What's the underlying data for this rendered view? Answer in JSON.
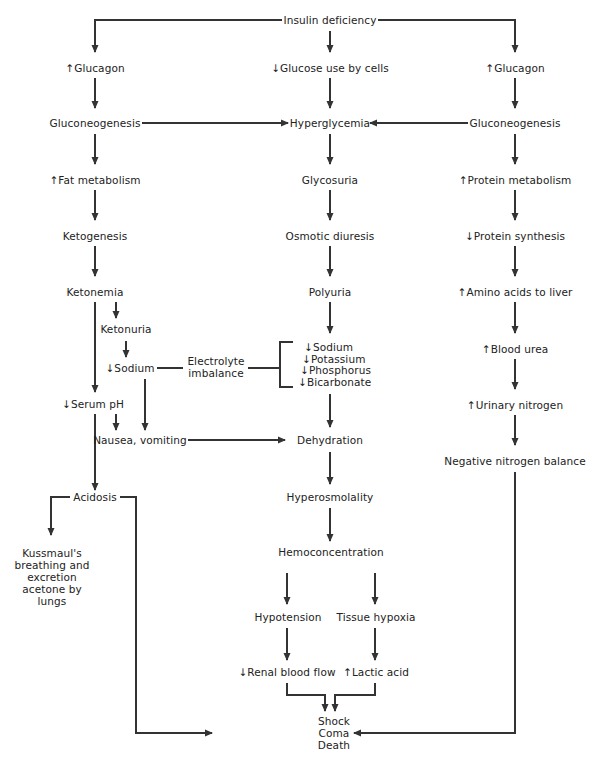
{
  "diagram": {
    "nodes": {
      "insulin_deficiency": "Insulin deficiency",
      "glucagon_left": "↑Glucagon",
      "glucose_use": "↓Glucose use by cells",
      "glucagon_right": "↑Glucagon",
      "gluconeogenesis_left": "Gluconeogenesis",
      "hyperglycemia": "Hyperglycemia",
      "gluconeogenesis_right": "Gluconeogenesis",
      "fat_metabolism": "↑Fat metabolism",
      "glycosuria": "Glycosuria",
      "protein_metabolism": "↑Protein metabolism",
      "ketogenesis": "Ketogenesis",
      "osmotic_diuresis": "Osmotic diuresis",
      "protein_synthesis": "↓Protein synthesis",
      "ketonemia": "Ketonemia",
      "polyuria": "Polyuria",
      "amino_acids": "↑Amino acids to liver",
      "ketonuria": "Ketonuria",
      "sodium_left": "↓Sodium",
      "electrolyte_1": "Electrolyte",
      "electrolyte_2": "imbalance",
      "electrolytes": [
        "↓Sodium",
        "↓Potassium",
        "↓Phosphorus",
        "↓Bicarbonate"
      ],
      "blood_urea": "↑Blood urea",
      "serum_ph": "↓Serum pH",
      "urinary_nitrogen": "↑Urinary nitrogen",
      "nausea": "Nausea, vomiting",
      "dehydration": "Dehydration",
      "negative_nitrogen": "Negative nitrogen balance",
      "acidosis": "Acidosis",
      "hyperosmolality": "Hyperosmolality",
      "kussmaul": [
        "Kussmaul's",
        "breathing and",
        "excretion",
        "acetone by",
        "lungs"
      ],
      "hemoconcentration": "Hemoconcentration",
      "hypotension": "Hypotension",
      "tissue_hypoxia": "Tissue hypoxia",
      "renal_blood_flow": "↓Renal blood flow",
      "lactic_acid": "↑Lactic acid",
      "outcome": [
        "Shock",
        "Coma",
        "Death"
      ]
    },
    "colors": {
      "line": "#333333",
      "text": "#222222",
      "background": "#ffffff"
    }
  }
}
